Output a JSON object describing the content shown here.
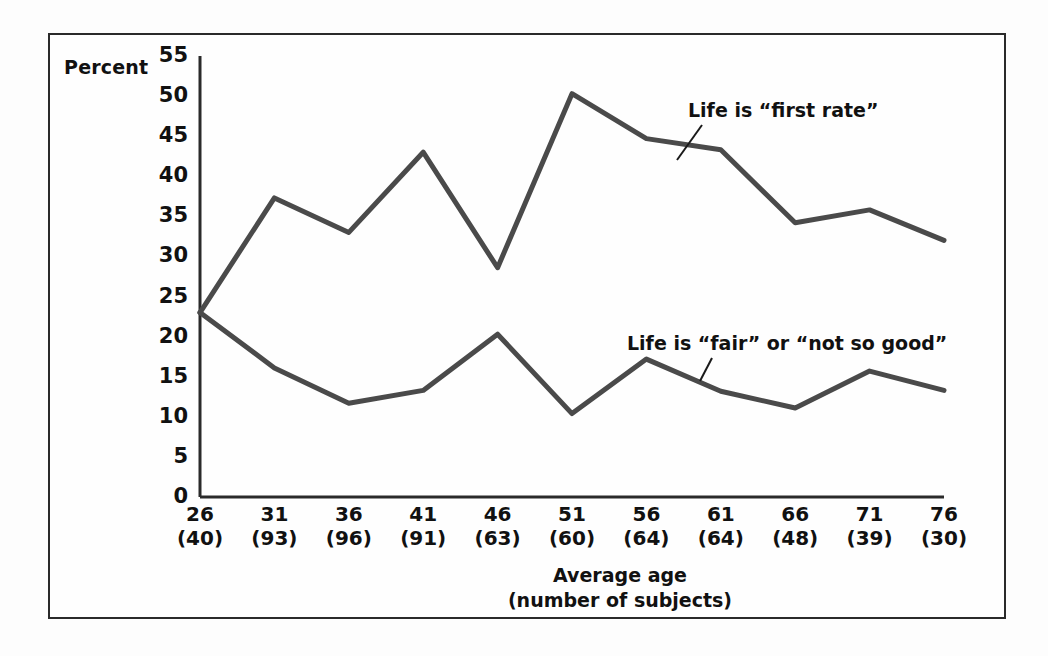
{
  "chart_data": {
    "type": "line",
    "title": "",
    "xlabel": "Average age\n(number of subjects)",
    "ylabel": "Percent",
    "ylim": [
      0,
      55
    ],
    "yticks": [
      0,
      5,
      10,
      15,
      20,
      25,
      30,
      35,
      40,
      45,
      50,
      55
    ],
    "grid": false,
    "legend_position": "inline-annotations",
    "categories": [
      "26",
      "31",
      "36",
      "41",
      "46",
      "51",
      "56",
      "61",
      "66",
      "71",
      "76"
    ],
    "subject_counts": [
      "(40)",
      "(93)",
      "(96)",
      "(91)",
      "(63)",
      "(60)",
      "(64)",
      "(64)",
      "(48)",
      "(39)",
      "(30)"
    ],
    "x": [
      26,
      31,
      36,
      41,
      46,
      51,
      56,
      61,
      66,
      71,
      76
    ],
    "series": [
      {
        "name": "Life is “first rate”",
        "color": "#4a4a4a",
        "values": [
          23,
          37.3,
          33,
          43,
          28.6,
          50.3,
          44.7,
          43.3,
          34.2,
          35.8,
          32
        ]
      },
      {
        "name": "Life is “fair” or “not so good”",
        "color": "#4a4a4a",
        "values": [
          23,
          16.1,
          11.7,
          13.3,
          20.3,
          10.4,
          17.2,
          13.2,
          11.1,
          15.7,
          13.3
        ]
      }
    ],
    "annotations": [
      {
        "text": "Life is “first rate”",
        "series": 0
      },
      {
        "text": "Life is “fair” or “not so good”",
        "series": 1
      }
    ]
  },
  "axis": {
    "y_label": "Percent",
    "y_ticks": [
      "55",
      "50",
      "45",
      "40",
      "35",
      "30",
      "25",
      "20",
      "15",
      "10",
      "5",
      "0"
    ],
    "x_ticks": [
      {
        "age": "26",
        "count": "(40)"
      },
      {
        "age": "31",
        "count": "(93)"
      },
      {
        "age": "36",
        "count": "(96)"
      },
      {
        "age": "41",
        "count": "(91)"
      },
      {
        "age": "46",
        "count": "(63)"
      },
      {
        "age": "51",
        "count": "(60)"
      },
      {
        "age": "56",
        "count": "(64)"
      },
      {
        "age": "61",
        "count": "(64)"
      },
      {
        "age": "66",
        "count": "(48)"
      },
      {
        "age": "71",
        "count": "(39)"
      },
      {
        "age": "76",
        "count": "(30)"
      }
    ],
    "x_title_line1": "Average age",
    "x_title_line2": "(number of subjects)"
  },
  "annotations": {
    "first_rate": "Life is “first rate”",
    "fair_or_not_so_good": "Life is “fair” or “not so good”"
  },
  "colors": {
    "line": "#4a4a4a",
    "axis": "#2a2a2a",
    "text": "#111111",
    "background": "#fefefe",
    "frame": "#2a2a2a"
  }
}
